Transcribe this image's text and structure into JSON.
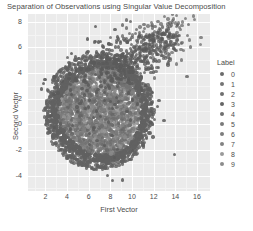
{
  "chart_data": {
    "type": "scatter",
    "title": "Separation of Observations using Singular Value Decomposition",
    "xlabel": "First Vector",
    "ylabel": "Second Vector",
    "xlim": [
      0.4,
      17.2
    ],
    "ylim": [
      -5.2,
      8.6
    ],
    "xticks": [
      2,
      4,
      6,
      8,
      10,
      12,
      14,
      16
    ],
    "yticks": [
      8,
      6,
      4,
      2,
      0,
      -2,
      -4
    ],
    "grid": true,
    "grid_color": "#ffffff",
    "panel_background": "#ebebeb",
    "legend": {
      "title": "Label",
      "position": "right",
      "entries": [
        {
          "label": "0",
          "color": "#6b6b6b"
        },
        {
          "label": "1",
          "color": "#747474"
        },
        {
          "label": "2",
          "color": "#6f6f6f"
        },
        {
          "label": "3",
          "color": "#656565"
        },
        {
          "label": "4",
          "color": "#707070"
        },
        {
          "label": "5",
          "color": "#7a7a7a"
        },
        {
          "label": "6",
          "color": "#7d7d7d"
        },
        {
          "label": "7",
          "color": "#828282"
        },
        {
          "label": "8",
          "color": "#9a9a9a"
        },
        {
          "label": "9",
          "color": "#8c8c8c"
        }
      ]
    },
    "cloud": {
      "center_x": 7.0,
      "center_y": 1.0,
      "radius_x": 4.4,
      "radius_y": 3.9,
      "core_color": "#7e7e7e",
      "edge_color": "#616161"
    },
    "tail": {
      "from": [
        6.0,
        3.5
      ],
      "to": [
        14.0,
        7.2
      ],
      "color": "#5a5a5a"
    }
  }
}
